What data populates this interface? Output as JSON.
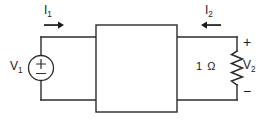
{
  "diagram": {
    "stroke_color": "#2b2b2b",
    "text_color": "#1a1a1a",
    "background": "#ffffff",
    "labels": {
      "current_1": "I",
      "current_1_sub": "1",
      "current_2": "I",
      "current_2_sub": "2",
      "voltage_1": "V",
      "voltage_1_sub": "1",
      "voltage_2": "V",
      "voltage_2_sub": "2",
      "resistor": "1 Ω",
      "terminal_plus": "+",
      "terminal_minus": "−",
      "source_plus": "+",
      "source_minus": "−"
    },
    "components": {
      "source": "voltage-source-circle",
      "network": "two-port-black-box",
      "load": "resistor-zigzag"
    },
    "arrows": {
      "i1_direction": "right",
      "i2_direction": "left"
    }
  }
}
